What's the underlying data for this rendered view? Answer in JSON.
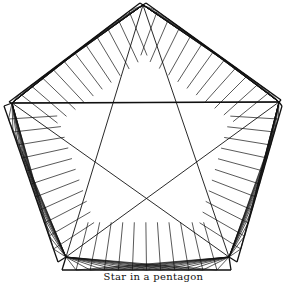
{
  "figure": {
    "caption": "Star in a pentagon",
    "stroke_color": "#111111",
    "background": "#ffffff",
    "divisions_per_side": 12,
    "star_tips": {
      "top": [
        143,
        5
      ],
      "right": [
        279,
        102
      ],
      "bottom_right": [
        229,
        257
      ],
      "bottom_left": [
        66,
        257
      ],
      "left": [
        12,
        103
      ]
    },
    "panels": [
      {
        "name": "upper-left",
        "outer": [
          [
            9,
            102
          ],
          [
            140,
            3
          ]
        ],
        "tip": "right",
        "tip2": "bottom_right"
      },
      {
        "name": "upper-right",
        "outer": [
          [
            146,
            3
          ],
          [
            281,
            100
          ]
        ],
        "tip": "left",
        "tip2": "bottom_left"
      },
      {
        "name": "right",
        "outer": [
          [
            282,
            106
          ],
          [
            237,
            262
          ]
        ],
        "tip": "left",
        "tip2": "top"
      },
      {
        "name": "bottom",
        "outer": [
          [
            231,
            270
          ],
          [
            62,
            270
          ]
        ],
        "tip": "top",
        "tip2": "top"
      },
      {
        "name": "left",
        "outer": [
          [
            58,
            262
          ],
          [
            4,
            106
          ]
        ],
        "tip": "right",
        "tip2": "top"
      }
    ]
  }
}
